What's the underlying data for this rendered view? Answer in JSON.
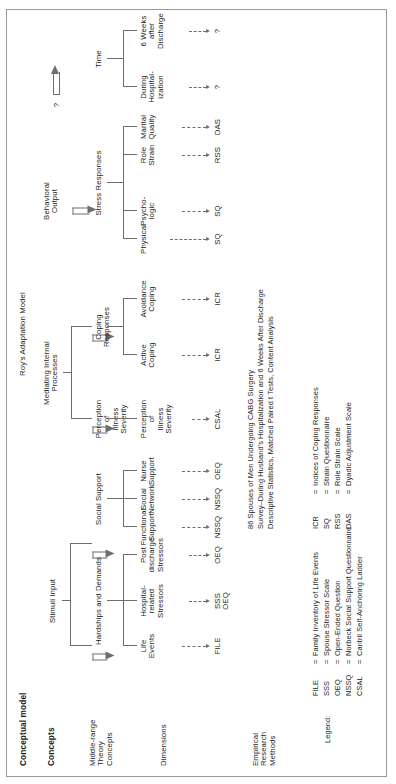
{
  "figure": {
    "header_left": "Conceptual model",
    "header_model": "Roy's Adaptation Model",
    "row_labels": {
      "concepts": "Concepts",
      "midrange": "Middle-range\nTheory\nConcepts",
      "dimensions": "Dimensions",
      "empirical": "Empirical\nResearch\nMethods"
    }
  },
  "concepts": [
    {
      "id": "stimuli",
      "label": "Stimuli Input"
    },
    {
      "id": "mediating",
      "label": "Mediating Internal\nProcesses"
    },
    {
      "id": "behavioral",
      "label": "Behavioral\nOutput"
    },
    {
      "id": "time_q",
      "label": "?"
    }
  ],
  "midrange": [
    {
      "id": "hardships",
      "label": "Hardships and Demands"
    },
    {
      "id": "social",
      "label": "Social Support"
    },
    {
      "id": "perception",
      "label": "Perception\nof\nIllness\nSeverity"
    },
    {
      "id": "coping",
      "label": "Coping\nResponses"
    },
    {
      "id": "stress",
      "label": "Stress Responses"
    },
    {
      "id": "time",
      "label": "Time"
    }
  ],
  "dimensions": [
    {
      "id": "life_events",
      "label": "Life\nEvents",
      "method": "FILE"
    },
    {
      "id": "hosp_stressors",
      "label": "Hospital-\nrelated\nStressors",
      "method": "SSS\nOEQ"
    },
    {
      "id": "post_stressors",
      "label": "Post\ndischarge\nStressors",
      "method": "OEQ"
    },
    {
      "id": "functional",
      "label": "Functional\nSupport",
      "method": "NSSQ"
    },
    {
      "id": "network",
      "label": "Social\nNetwork",
      "method": "NSSQ"
    },
    {
      "id": "nurse",
      "label": "Nurse\nSupport",
      "method": "OEQ"
    },
    {
      "id": "illness_severity",
      "label": "Perception\nof\nIllness\nSeverity",
      "method": "CSAL"
    },
    {
      "id": "active",
      "label": "Active\nCoping",
      "method": "ICR"
    },
    {
      "id": "avoidance",
      "label": "Avoidance\nCoping",
      "method": "ICR"
    },
    {
      "id": "physical",
      "label": "Physical",
      "method": "SQ"
    },
    {
      "id": "psychologic",
      "label": "Psycho-\nlogic",
      "method": "SQ"
    },
    {
      "id": "role_strain",
      "label": "Role\nStrain",
      "method": "RSS"
    },
    {
      "id": "marital",
      "label": "Marital\nQuality",
      "method": "DAS"
    },
    {
      "id": "during_hosp",
      "label": "During\nHospital-\nization",
      "method": "?"
    },
    {
      "id": "six_weeks",
      "label": "6 Weeks\nafter\nDischarge",
      "method": "?"
    }
  ],
  "sample_note": {
    "line1": "86 Spouses of Men Undergoing CABG Surgery",
    "line2": "Survey–During Husband's Hospitalization and 6 Weeks After Discharge",
    "line3": "Descriptive Statistics, Matched Paired t Tests, Content Analysis"
  },
  "legend": {
    "title": "Legend:",
    "column1": [
      {
        "abbr": "FILE",
        "eq": "=",
        "text": "Family Inventory of Life Events"
      },
      {
        "abbr": "SSS",
        "eq": "=",
        "text": "Spouse Stressor Scale"
      },
      {
        "abbr": "OEQ",
        "eq": "=",
        "text": "Open-Ended Question"
      },
      {
        "abbr": "NSSQ",
        "eq": "=",
        "text": "Norbeck Social Support Questionnaire"
      },
      {
        "abbr": "CSAL",
        "eq": "=",
        "text": "Cantril Self-Anchoring Ladder"
      }
    ],
    "column2": [
      {
        "abbr": "ICR",
        "eq": "=",
        "text": "Indices of Coping Responses"
      },
      {
        "abbr": "SQ",
        "eq": "=",
        "text": "Strain Questionnaire"
      },
      {
        "abbr": "RSS",
        "eq": "=",
        "text": "Role Strain Scale"
      },
      {
        "abbr": "DAS",
        "eq": "=",
        "text": "Dyadic Adjustment Scale"
      }
    ]
  }
}
